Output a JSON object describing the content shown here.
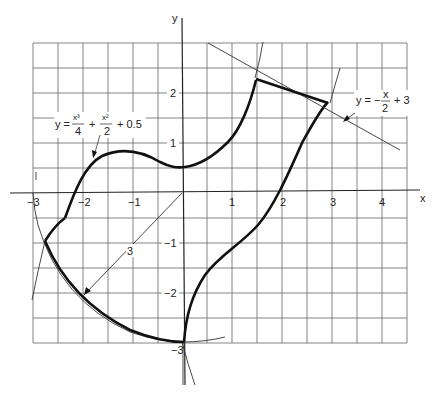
{
  "figure": {
    "axes": {
      "x_label": "x",
      "y_label": "y",
      "x_ticks": [
        {
          "value": -3,
          "label": "−3"
        },
        {
          "value": -2,
          "label": "−2"
        },
        {
          "value": -1,
          "label": "−1"
        },
        {
          "value": 1,
          "label": "1"
        },
        {
          "value": 2,
          "label": "2"
        },
        {
          "value": 3,
          "label": "3"
        },
        {
          "value": 4,
          "label": "4"
        }
      ],
      "y_ticks": [
        {
          "value": 2,
          "label": "2"
        },
        {
          "value": 1,
          "label": "1"
        },
        {
          "value": -1,
          "label": "−1"
        },
        {
          "value": -2,
          "label": "−2"
        },
        {
          "value": -3,
          "label": "−3"
        }
      ],
      "x_range": [
        -3,
        4.5
      ],
      "y_range": [
        -3,
        3
      ],
      "grid_step": 0.5
    },
    "curves": [
      {
        "name": "cubic",
        "equation_lhs": "y =",
        "term1_num": "x³",
        "term1_den": "4",
        "plus1": "+",
        "term2_num": "x²",
        "term2_den": "2",
        "plus2": "+ 0.5"
      },
      {
        "name": "line",
        "equation_lhs": "y = −",
        "term_num": "x",
        "term_den": "2",
        "plus": "+ 3"
      }
    ],
    "radius_label": "3"
  }
}
